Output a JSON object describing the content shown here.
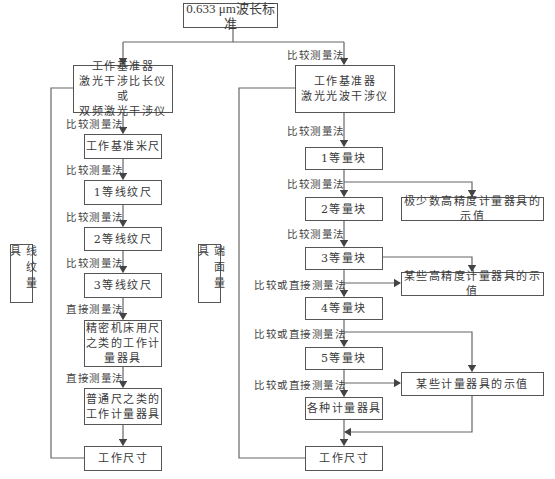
{
  "title": "0.633 μm波长标准",
  "left": {
    "side_label": "线纹量具",
    "reference": "工作基准器\n激光干涉比长仪或\n双频激光干涉仪",
    "boxes": [
      "工作基准米尺",
      "1等线纹尺",
      "2等线纹尺",
      "3等线纹尺",
      "精密机床用尺\n之类的工作计\n量器具",
      "普通尺之类的\n工作计量器具",
      "工作尺寸"
    ],
    "methods": [
      "比较测量法",
      "比较测量法",
      "比较测量法",
      "比较测量法",
      "直接测量法",
      "直接测量法"
    ]
  },
  "right": {
    "side_label": "端面量具",
    "top_method": "比较测量法",
    "reference": "工作基准器\n激光光波干涉仪",
    "boxes": [
      "1等量块",
      "2等量块",
      "3等量块",
      "4等量块",
      "5等量块",
      "各种计量器具",
      "工作尺寸"
    ],
    "methods": [
      "比较测量法",
      "比较测量法",
      "比较测量法",
      "比较或直接测量法",
      "比较或直接测量法",
      "比较或直接测量法"
    ],
    "side_boxes": [
      "极少数高精度计量器具的示值",
      "某些高精度计量器具的示值",
      "某些计量器具的示值"
    ]
  },
  "colors": {
    "line": "#555555",
    "text": "#3a3a3a",
    "background": "#ffffff"
  }
}
